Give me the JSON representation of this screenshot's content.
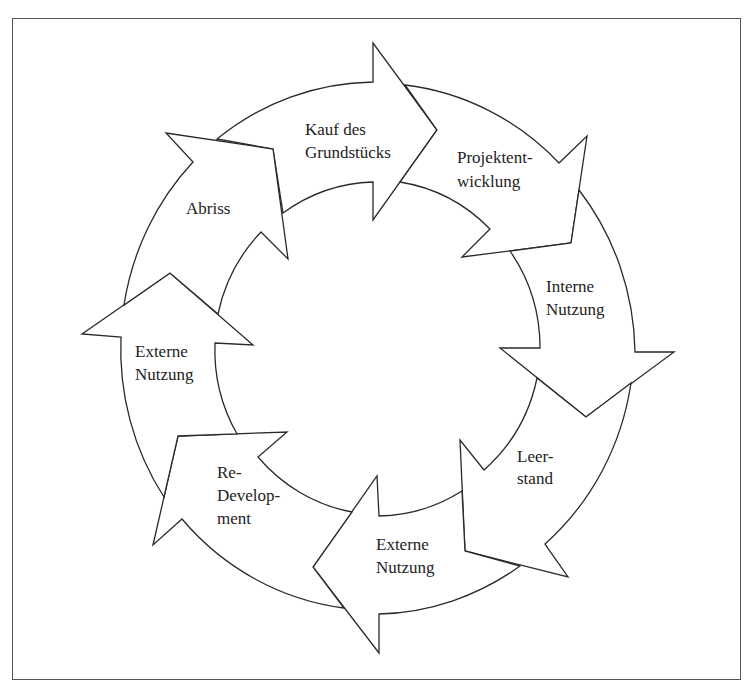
{
  "diagram": {
    "type": "cycle",
    "title": "",
    "steps": [
      {
        "id": "kauf",
        "lines": [
          "Kauf des",
          "Grundstücks"
        ],
        "x": 305,
        "y": [
          135,
          158
        ]
      },
      {
        "id": "projekt",
        "lines": [
          "Projektent-",
          "wicklung"
        ],
        "x": 457,
        "y": [
          163,
          187
        ]
      },
      {
        "id": "interne",
        "lines": [
          "Interne",
          "Nutzung"
        ],
        "x": 546,
        "y": [
          292,
          315
        ]
      },
      {
        "id": "leerstand",
        "lines": [
          "Leer-",
          "stand"
        ],
        "x": 517,
        "y": [
          462,
          484
        ]
      },
      {
        "id": "externe-bottom",
        "lines": [
          "Externe",
          "Nutzung"
        ],
        "x": 376,
        "y": [
          550,
          573
        ]
      },
      {
        "id": "redevelopment",
        "lines": [
          "Re-",
          "Develop-",
          "ment"
        ],
        "x": 217,
        "y": [
          478,
          501,
          524
        ]
      },
      {
        "id": "externe-left",
        "lines": [
          "Externe",
          "Nutzung"
        ],
        "x": 135,
        "y": [
          357,
          380
        ]
      },
      {
        "id": "abriss",
        "lines": [
          "Abriss"
        ],
        "x": 186,
        "y": [
          214
        ]
      }
    ],
    "flow_direction": "clockwise",
    "colors": {
      "stroke": "#2a2a2a",
      "fill": "#ffffff",
      "frame": "#555555",
      "text": "#222222"
    }
  }
}
